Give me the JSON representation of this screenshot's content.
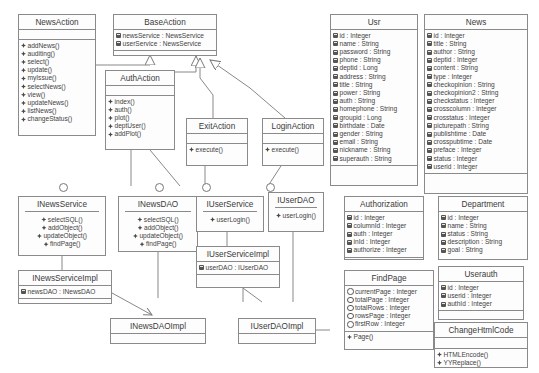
{
  "diagram": {
    "classes": [
      {
        "id": "NewsAction",
        "name": "NewsAction",
        "kind": "class",
        "attributes": [],
        "methods": [
          "addNews()",
          "auditing()",
          "select()",
          "update()",
          "myIssue()",
          "selectNews()",
          "view()",
          "updateNews()",
          "listNews()",
          "changeStatus()"
        ]
      },
      {
        "id": "BaseAction",
        "name": "BaseAction",
        "kind": "class",
        "attributes": [
          "newsService : NewsService",
          "userService : NewsService"
        ],
        "methods": []
      },
      {
        "id": "AuthAction",
        "name": "AuthAction",
        "kind": "class",
        "attributes": [],
        "methods": [
          "index()",
          "auth()",
          "plot()",
          "deptUser()",
          "addPlot()"
        ]
      },
      {
        "id": "ExitAction",
        "name": "ExitAction",
        "kind": "class",
        "attributes": [],
        "methods": [
          "execute()"
        ]
      },
      {
        "id": "LoginAction",
        "name": "LoginAction",
        "kind": "class",
        "attributes": [],
        "methods": [
          "execute()"
        ]
      },
      {
        "id": "INewsService",
        "name": "INewsService",
        "kind": "interface",
        "attributes": [],
        "methods": [
          "selectSQL()",
          "addObject()",
          "updateObject()",
          "findPage()"
        ]
      },
      {
        "id": "INewsDAO",
        "name": "INewsDAO",
        "kind": "interface",
        "attributes": [],
        "methods": [
          "selectSQL()",
          "addObject()",
          "updateObject()",
          "findPage()"
        ]
      },
      {
        "id": "IUserService",
        "name": "IUserService",
        "kind": "interface",
        "attributes": [],
        "methods": [
          "userLogin()"
        ]
      },
      {
        "id": "IUserDAO",
        "name": "IUserDAO",
        "kind": "interface",
        "attributes": [],
        "methods": [
          "userLogin()"
        ]
      },
      {
        "id": "INewsServiceImpl",
        "name": "INewsServiceImpl",
        "kind": "class",
        "attributes": [
          "newsDAO : INewsDAO"
        ],
        "methods": []
      },
      {
        "id": "INewsDAOImpl",
        "name": "INewsDAOImpl",
        "kind": "class",
        "attributes": [],
        "methods": []
      },
      {
        "id": "IUserServiceImpl",
        "name": "IUserServiceImpl",
        "kind": "class",
        "attributes": [
          "userDAO : IUserDAO"
        ],
        "methods": []
      },
      {
        "id": "IUserDAOImpl",
        "name": "IUserDAOImpl",
        "kind": "class",
        "attributes": [],
        "methods": []
      },
      {
        "id": "Usr",
        "name": "Usr",
        "kind": "class",
        "attributes": [
          "id : Integer",
          "name : String",
          "password : String",
          "phone : String",
          "deptid : Long",
          "address : String",
          "title : String",
          "power : String",
          "auth : String",
          "homephone : String",
          "groupid : Long",
          "birthdate : Date",
          "gender : String",
          "email : String",
          "nickname : String",
          "superauth : String"
        ],
        "methods": []
      },
      {
        "id": "News",
        "name": "News",
        "kind": "class",
        "attributes": [
          "id : Integer",
          "title : String",
          "author : String",
          "deptid : Integer",
          "content : String",
          "type : Integer",
          "checkopinion : String",
          "checkopinion2 : String",
          "checkstatus : Integer",
          "crosscolumn : Integer",
          "crosstatus : Integer",
          "picturepath : String",
          "publishtime : Date",
          "crosspubtime : Date",
          "preface : Integer",
          "status : Integer",
          "userid : Integer"
        ],
        "methods": []
      },
      {
        "id": "Authorization",
        "name": "Authorization",
        "kind": "class",
        "attributes": [
          "id : Integer",
          "columnId : Integer",
          "auth : Integer",
          "inId : Integer",
          "authorize : Integer"
        ],
        "methods": []
      },
      {
        "id": "Department",
        "name": "Department",
        "kind": "class",
        "attributes": [
          "id : Integer",
          "name : String",
          "status : String",
          "description : String",
          "goal : String"
        ],
        "methods": []
      },
      {
        "id": "FindPage",
        "name": "FindPage",
        "kind": "class",
        "attributes": [
          "currentPage : Integer",
          "totalPage : Integer",
          "totalRows : Integer",
          "rowsPage : Integer",
          "firstRow : Integer"
        ],
        "methods": [
          "Page()"
        ]
      },
      {
        "id": "Userauth",
        "name": "Userauth",
        "kind": "class",
        "attributes": [
          "id : Integer",
          "userid : Integer",
          "authId : Integer"
        ],
        "methods": []
      },
      {
        "id": "ChangeHtmlCode",
        "name": "ChangeHtmlCode",
        "kind": "class",
        "attributes": [],
        "methods": [
          "HTMLEncode()",
          "YYReplace()"
        ]
      }
    ],
    "colors": {
      "box_border": "#8a8a8a",
      "box_fill": "#fdfdfd",
      "text": "#3f3f3f",
      "line": "#7a7a7a"
    }
  }
}
